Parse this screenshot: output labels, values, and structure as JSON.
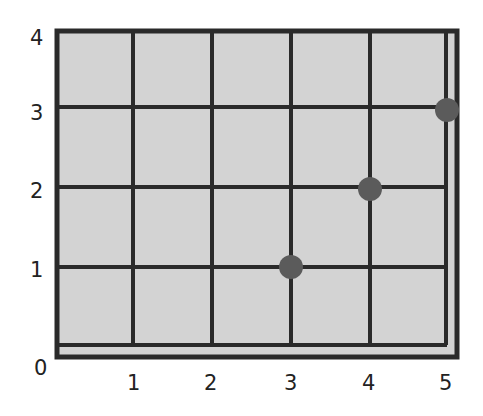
{
  "chart_data": {
    "type": "scatter",
    "title": "",
    "xlabel": "",
    "ylabel": "",
    "grid": true,
    "xlim": [
      0,
      5
    ],
    "ylim": [
      0,
      4
    ],
    "x_ticks": [
      "1",
      "2",
      "3",
      "4",
      "5"
    ],
    "y_ticks": [
      "1",
      "2",
      "3",
      "4"
    ],
    "origin_label": "0",
    "points": [
      {
        "x": 3,
        "y": 1
      },
      {
        "x": 4,
        "y": 2
      },
      {
        "x": 5,
        "y": 3
      }
    ]
  },
  "colors": {
    "background": "#ffffff",
    "plot_fill": "#d3d3d3",
    "grid_line": "#2a2a2a",
    "point": "#5b5b5b",
    "text": "#222222"
  }
}
